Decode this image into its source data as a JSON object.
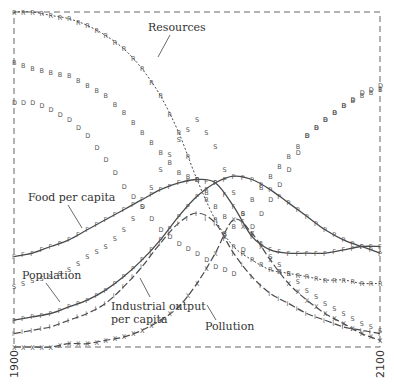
{
  "chart_data": {
    "type": "line",
    "title": "",
    "xlabel": "",
    "ylabel": "",
    "xlim": [
      1900,
      2100
    ],
    "ylim": [
      0,
      1
    ],
    "grid": false,
    "x_ticks": [
      "1900",
      "2100"
    ],
    "legend": "inline-labels",
    "x": [
      1900,
      1910,
      1920,
      1930,
      1940,
      1950,
      1960,
      1970,
      1980,
      1990,
      2000,
      2010,
      2020,
      2030,
      2040,
      2050,
      2060,
      2070,
      2080,
      2090,
      2100
    ],
    "series": [
      {
        "name": "Resources",
        "marker": "R",
        "style": "dotted",
        "values": [
          1.0,
          1.0,
          0.99,
          0.98,
          0.96,
          0.93,
          0.89,
          0.83,
          0.75,
          0.64,
          0.5,
          0.38,
          0.3,
          0.26,
          0.23,
          0.22,
          0.21,
          0.2,
          0.2,
          0.19,
          0.19
        ]
      },
      {
        "name": "Food per capita",
        "marker": "F",
        "style": "solid",
        "values": [
          0.27,
          0.28,
          0.3,
          0.32,
          0.35,
          0.38,
          0.41,
          0.44,
          0.47,
          0.49,
          0.5,
          0.49,
          0.42,
          0.33,
          0.29,
          0.28,
          0.28,
          0.28,
          0.29,
          0.3,
          0.3
        ]
      },
      {
        "name": "Population",
        "marker": "P",
        "style": "solid",
        "values": [
          0.08,
          0.09,
          0.1,
          0.12,
          0.14,
          0.17,
          0.21,
          0.26,
          0.32,
          0.39,
          0.45,
          0.49,
          0.51,
          0.5,
          0.47,
          0.43,
          0.39,
          0.35,
          0.32,
          0.3,
          0.28
        ]
      },
      {
        "name": "Industrial output per capita",
        "marker": "I",
        "style": "dashed",
        "values": [
          0.04,
          0.05,
          0.06,
          0.08,
          0.1,
          0.13,
          0.18,
          0.24,
          0.31,
          0.37,
          0.4,
          0.37,
          0.28,
          0.21,
          0.16,
          0.13,
          0.1,
          0.08,
          0.06,
          0.05,
          0.04
        ]
      },
      {
        "name": "Pollution",
        "marker": "X",
        "style": "dashed",
        "values": [
          0.0,
          0.0,
          0.0,
          0.01,
          0.01,
          0.02,
          0.03,
          0.05,
          0.08,
          0.12,
          0.19,
          0.28,
          0.38,
          0.34,
          0.26,
          0.19,
          0.14,
          0.1,
          0.07,
          0.04,
          0.02
        ]
      },
      {
        "name": "B",
        "marker": "B",
        "style": "markers-only",
        "values": [
          0.85,
          0.83,
          0.82,
          0.81,
          0.78,
          0.75,
          0.7,
          0.64,
          0.58,
          0.52,
          0.5,
          0.42,
          0.36,
          0.44,
          0.51,
          0.57,
          0.63,
          0.68,
          0.72,
          0.75,
          0.77
        ]
      },
      {
        "name": "D",
        "marker": "D",
        "style": "markers-only",
        "values": [
          0.73,
          0.73,
          0.71,
          0.68,
          0.63,
          0.56,
          0.48,
          0.42,
          0.35,
          0.31,
          0.28,
          0.24,
          0.22,
          0.36,
          0.44,
          0.53,
          0.63,
          0.68,
          0.72,
          0.76,
          0.78
        ]
      },
      {
        "name": "S",
        "marker": "S",
        "style": "markers-only",
        "values": [
          0.18,
          0.2,
          0.21,
          0.23,
          0.27,
          0.3,
          0.35,
          0.42,
          0.53,
          0.62,
          0.68,
          0.6,
          0.46,
          0.34,
          0.27,
          0.22,
          0.17,
          0.13,
          0.1,
          0.07,
          0.05
        ]
      }
    ],
    "annotations": [
      {
        "text": "Resources",
        "x": 2022,
        "y": 0.95
      },
      {
        "text": "Food per capita",
        "x": 1950,
        "y": 0.53
      },
      {
        "text": "Population",
        "x": 1915,
        "y": 0.24
      },
      {
        "text": "Industrial output",
        "x": 2006,
        "y": 0.14
      },
      {
        "text": "per capita",
        "x": 2006,
        "y": 0.1
      },
      {
        "text": "Pollution",
        "x": 2042,
        "y": 0.09
      }
    ]
  },
  "axis": {
    "x_start_label": "1900",
    "x_end_label": "2100"
  },
  "labels": {
    "resources": "Resources",
    "food": "Food per capita",
    "population": "Population",
    "industrial_1": "Industrial output",
    "industrial_2": "per capita",
    "pollution": "Pollution"
  }
}
